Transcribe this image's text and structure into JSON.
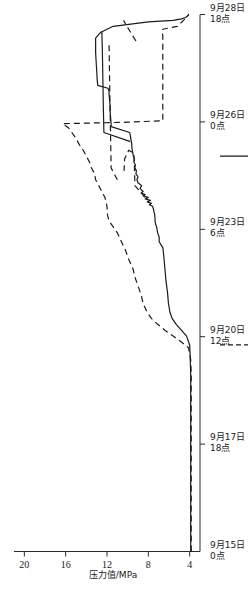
{
  "chart_data": {
    "type": "line",
    "title": "",
    "xlabel": "",
    "ylabel": "压力值/MPa",
    "orientation": "rotated-90-ccw",
    "x_tick_labels": [
      {
        "line1": "9月15日",
        "line2": "0点"
      },
      {
        "line1": "9月17日",
        "line2": "18点"
      },
      {
        "line1": "9月20日",
        "line2": "12点"
      },
      {
        "line1": "9月23日",
        "line2": "6点"
      },
      {
        "line1": "9月26日",
        "line2": "0点"
      },
      {
        "line1": "9月28日",
        "line2": "18点"
      }
    ],
    "y_tick_labels": [
      "4",
      "8",
      "12",
      "16",
      "20"
    ],
    "ylim": [
      3,
      21
    ],
    "grid": false,
    "legend_position": "below-axis",
    "legend": [
      {
        "style": "dashed",
        "label": "浅基点：9 m(103号)曲线"
      },
      {
        "style": "solid",
        "label": "深基点：15 m(104号)曲线"
      }
    ],
    "series": [
      {
        "name": "深基点：15 m(104号)曲线",
        "style": "solid",
        "points": [
          [
            0.0,
            3.9
          ],
          [
            1.0,
            3.9
          ],
          [
            2.0,
            3.9
          ],
          [
            3.0,
            3.9
          ],
          [
            4.0,
            3.9
          ],
          [
            5.0,
            3.9
          ],
          [
            6.0,
            3.9
          ],
          [
            6.6,
            3.95
          ],
          [
            7.0,
            4.0
          ],
          [
            7.3,
            4.3
          ],
          [
            7.5,
            4.8
          ],
          [
            7.7,
            5.3
          ],
          [
            7.9,
            5.7
          ],
          [
            8.1,
            5.9
          ],
          [
            8.4,
            6.05
          ],
          [
            8.8,
            6.15
          ],
          [
            9.2,
            6.3
          ],
          [
            9.6,
            6.4
          ],
          [
            10.0,
            6.5
          ],
          [
            10.3,
            6.6
          ],
          [
            10.5,
            6.95
          ],
          [
            10.65,
            6.95
          ],
          [
            10.8,
            7.1
          ],
          [
            10.9,
            7.15
          ],
          [
            11.0,
            7.2
          ],
          [
            11.1,
            7.3
          ],
          [
            11.2,
            7.35
          ],
          [
            11.3,
            7.35
          ],
          [
            11.45,
            7.4
          ],
          [
            11.5,
            7.45
          ],
          [
            11.6,
            7.5
          ],
          [
            11.65,
            7.55
          ],
          [
            11.7,
            7.6
          ],
          [
            11.75,
            7.9
          ],
          [
            11.8,
            7.7
          ],
          [
            11.85,
            8.1
          ],
          [
            11.9,
            7.8
          ],
          [
            11.95,
            8.3
          ],
          [
            12.0,
            8.0
          ],
          [
            12.05,
            8.5
          ],
          [
            12.1,
            8.3
          ],
          [
            12.15,
            8.7
          ],
          [
            12.2,
            8.5
          ],
          [
            12.3,
            8.8
          ],
          [
            12.4,
            8.65
          ],
          [
            12.5,
            9.0
          ],
          [
            12.6,
            9.1
          ],
          [
            12.7,
            9.0
          ],
          [
            12.8,
            9.2
          ],
          [
            12.9,
            9.15
          ],
          [
            13.0,
            9.3
          ],
          [
            13.1,
            9.25
          ],
          [
            13.2,
            9.4
          ],
          [
            13.3,
            9.35
          ],
          [
            13.4,
            9.45
          ],
          [
            13.5,
            9.5
          ],
          [
            13.6,
            9.55
          ],
          [
            13.7,
            9.6
          ],
          [
            13.8,
            9.6
          ],
          [
            13.9,
            9.65
          ],
          [
            14.0,
            9.7
          ],
          [
            14.2,
            9.8
          ],
          [
            14.4,
            11.6
          ],
          [
            14.5,
            11.6
          ],
          [
            14.7,
            11.65
          ],
          [
            14.9,
            11.7
          ],
          [
            15.1,
            11.7
          ],
          [
            15.3,
            11.75
          ],
          [
            15.5,
            11.8
          ],
          [
            15.6,
            11.8
          ],
          [
            15.7,
            11.9
          ],
          [
            15.8,
            12.9
          ],
          [
            16.0,
            12.95
          ],
          [
            16.3,
            13.0
          ],
          [
            16.6,
            13.05
          ],
          [
            16.9,
            13.1
          ],
          [
            17.2,
            13.1
          ],
          [
            17.4,
            13.1
          ],
          [
            17.6,
            12.6
          ],
          [
            17.8,
            11.4
          ],
          [
            17.95,
            8.0
          ],
          [
            18.0,
            5.6
          ],
          [
            18.05,
            4.8
          ],
          [
            18.1,
            4.4
          ],
          [
            18.15,
            4.2
          ],
          [
            18.2,
            4.1
          ]
        ]
      },
      {
        "name": "浅基点：9 m(103号)曲线",
        "style": "dashed",
        "points": [
          [
            0.0,
            3.85
          ],
          [
            1.0,
            3.85
          ],
          [
            2.0,
            3.85
          ],
          [
            3.0,
            3.85
          ],
          [
            4.0,
            3.85
          ],
          [
            5.0,
            3.85
          ],
          [
            6.0,
            3.85
          ],
          [
            6.5,
            3.9
          ],
          [
            6.9,
            4.1
          ],
          [
            7.1,
            4.8
          ],
          [
            7.3,
            5.6
          ],
          [
            7.5,
            6.4
          ],
          [
            7.7,
            7.1
          ],
          [
            7.9,
            7.7
          ],
          [
            8.1,
            8.1
          ],
          [
            8.4,
            8.5
          ],
          [
            8.7,
            8.7
          ],
          [
            9.0,
            9.0
          ],
          [
            9.3,
            9.3
          ],
          [
            9.6,
            9.5
          ],
          [
            9.9,
            9.9
          ],
          [
            10.2,
            10.2
          ],
          [
            10.5,
            10.6
          ],
          [
            10.8,
            11.0
          ],
          [
            11.0,
            11.4
          ],
          [
            11.2,
            11.8
          ],
          [
            11.4,
            11.95
          ],
          [
            11.7,
            12.0
          ],
          [
            12.0,
            12.2
          ],
          [
            12.2,
            12.5
          ],
          [
            12.4,
            12.8
          ],
          [
            12.6,
            13.1
          ],
          [
            12.8,
            13.2
          ],
          [
            13.0,
            13.5
          ],
          [
            13.2,
            13.7
          ],
          [
            13.4,
            14.0
          ],
          [
            13.6,
            14.3
          ],
          [
            13.8,
            14.7
          ],
          [
            14.0,
            15.0
          ],
          [
            14.2,
            15.4
          ],
          [
            14.35,
            15.7
          ],
          [
            14.45,
            16.1
          ],
          [
            14.5,
            16.3
          ],
          [
            14.55,
            10.0
          ],
          [
            14.6,
            6.6
          ],
          [
            15.0,
            6.6
          ],
          [
            15.4,
            6.6
          ],
          [
            15.8,
            6.6
          ],
          [
            16.0,
            6.6
          ],
          [
            16.2,
            6.6
          ],
          [
            16.4,
            6.6
          ],
          [
            16.6,
            6.6
          ],
          [
            16.8,
            6.6
          ],
          [
            17.0,
            6.6
          ],
          [
            17.2,
            6.6
          ],
          [
            17.4,
            6.6
          ],
          [
            17.5,
            6.6
          ],
          [
            17.6,
            6.7
          ],
          [
            17.7,
            6.6
          ],
          [
            17.8,
            5.2
          ],
          [
            17.9,
            4.9
          ],
          [
            18.0,
            4.6
          ],
          [
            18.1,
            4.3
          ],
          [
            18.2,
            4.1
          ]
        ]
      }
    ],
    "secondary_segments": [
      {
        "name": "deep-branch-upper",
        "style": "solid",
        "points": [
          [
            13.9,
            9.8
          ],
          [
            14.2,
            12.3
          ],
          [
            15.0,
            12.35
          ],
          [
            16.0,
            12.4
          ],
          [
            17.0,
            12.45
          ],
          [
            17.6,
            12.5
          ]
        ]
      },
      {
        "name": "shallow-branch-a",
        "style": "dashed",
        "points": [
          [
            12.0,
            8.3
          ],
          [
            12.4,
            9.3
          ],
          [
            13.1,
            9.35
          ],
          [
            13.5,
            9.4
          ],
          [
            13.6,
            9.9
          ],
          [
            13.3,
            10.3
          ],
          [
            12.9,
            10.35
          ]
        ]
      },
      {
        "name": "shallow-branch-b",
        "style": "dashed",
        "points": [
          [
            12.6,
            11.0
          ],
          [
            13.0,
            11.6
          ],
          [
            14.0,
            11.65
          ],
          [
            15.0,
            11.7
          ],
          [
            16.0,
            11.75
          ],
          [
            17.2,
            11.8
          ]
        ]
      },
      {
        "name": "shallow-branch-c",
        "style": "dashed",
        "points": [
          [
            17.3,
            9.2
          ],
          [
            17.7,
            9.9
          ],
          [
            18.0,
            10.4
          ]
        ]
      }
    ]
  },
  "axis": {
    "y_axis_caption": "压力值/MPa"
  }
}
